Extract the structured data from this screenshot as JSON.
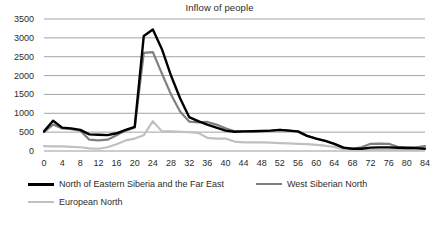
{
  "chart_data": {
    "type": "line",
    "title": "Inflow of people",
    "xlabel": "",
    "ylabel": "",
    "xlim": [
      0,
      84
    ],
    "ylim": [
      0,
      3500
    ],
    "grid": true,
    "grid_axis": "y",
    "legend_position": "bottom",
    "y_ticks": [
      3500,
      3000,
      2500,
      2000,
      1500,
      1000,
      500,
      0
    ],
    "x_ticks": [
      0,
      4,
      8,
      12,
      16,
      20,
      24,
      28,
      32,
      36,
      40,
      44,
      48,
      52,
      56,
      60,
      64,
      68,
      72,
      76,
      80,
      84
    ],
    "x": [
      0,
      2,
      4,
      6,
      8,
      10,
      12,
      14,
      16,
      18,
      20,
      22,
      24,
      26,
      28,
      30,
      32,
      34,
      36,
      38,
      40,
      42,
      44,
      46,
      48,
      50,
      52,
      54,
      56,
      58,
      60,
      62,
      64,
      66,
      68,
      70,
      72,
      74,
      76,
      78,
      80,
      82,
      84
    ],
    "series": [
      {
        "name": "North of Eastern Siberia and the Far East",
        "color": "#000000",
        "width": 2.4,
        "values": [
          520,
          800,
          620,
          600,
          560,
          440,
          430,
          420,
          470,
          560,
          640,
          3050,
          3220,
          2700,
          2000,
          1400,
          900,
          790,
          700,
          620,
          540,
          510,
          520,
          525,
          530,
          540,
          560,
          540,
          520,
          400,
          330,
          270,
          190,
          90,
          60,
          60,
          90,
          95,
          95,
          85,
          80,
          75,
          60
        ]
      },
      {
        "name": "West Siberian North",
        "color": "#7f7f7f",
        "width": 2.2,
        "values": [
          500,
          700,
          600,
          580,
          540,
          300,
          280,
          300,
          420,
          540,
          620,
          2600,
          2620,
          2050,
          1500,
          1050,
          780,
          760,
          770,
          700,
          600,
          520,
          520,
          525,
          530,
          540,
          560,
          540,
          510,
          400,
          330,
          270,
          190,
          90,
          60,
          100,
          190,
          195,
          190,
          110,
          100,
          95,
          130
        ]
      },
      {
        "name": "European North",
        "color": "#c0c0c0",
        "width": 2.2,
        "values": [
          130,
          120,
          120,
          110,
          100,
          70,
          60,
          100,
          180,
          280,
          330,
          420,
          790,
          520,
          520,
          510,
          500,
          480,
          350,
          330,
          330,
          250,
          230,
          230,
          230,
          220,
          210,
          200,
          190,
          180,
          160,
          140,
          110,
          50,
          30,
          30,
          30,
          30,
          30,
          30,
          30,
          30,
          60
        ]
      }
    ]
  },
  "legend": {
    "entries": [
      {
        "label": "North of Eastern Siberia and the Far East",
        "color": "#000000"
      },
      {
        "label": "West Siberian North",
        "color": "#7f7f7f"
      },
      {
        "label": "European North",
        "color": "#c0c0c0"
      }
    ]
  },
  "axis_colors": {
    "gridline": "#9a9a9a",
    "text": "#2b2b2b"
  }
}
